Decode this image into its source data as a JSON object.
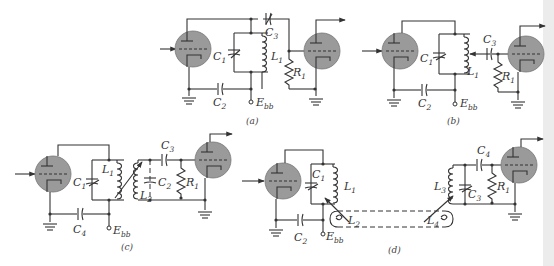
{
  "figure": {
    "colors": {
      "wire": "#333333",
      "tube_fill": "#9a9a9a",
      "background": "#ffffff",
      "right_margin": "#ececec"
    },
    "panels": [
      {
        "id": "a",
        "caption": "(a)",
        "labels": {
          "C1": "C",
          "C1_sub": "1",
          "L1": "L",
          "L1_sub": "1",
          "C2": "C",
          "C2_sub": "2",
          "C3": "C",
          "C3_sub": "3",
          "R1": "R",
          "R1_sub": "1",
          "Ebb": "E",
          "Ebb_sub": "bb"
        }
      },
      {
        "id": "b",
        "caption": "(b)",
        "labels": {
          "C1": "C",
          "C1_sub": "1",
          "L1": "L",
          "L1_sub": "1",
          "C2": "C",
          "C2_sub": "2",
          "C3": "C",
          "C3_sub": "3",
          "R1": "R",
          "R1_sub": "1",
          "Ebb": "E",
          "Ebb_sub": "bb"
        }
      },
      {
        "id": "c",
        "caption": "(c)",
        "labels": {
          "C1": "C",
          "C1_sub": "1",
          "L1": "L",
          "L1_sub": "1",
          "L2": "L",
          "L2_sub": "2",
          "C2": "C",
          "C2_sub": "2",
          "C3": "C",
          "C3_sub": "3",
          "C4": "C",
          "C4_sub": "4",
          "R1": "R",
          "R1_sub": "1",
          "Ebb": "E",
          "Ebb_sub": "bb"
        }
      },
      {
        "id": "d",
        "caption": "(d)",
        "labels": {
          "C1": "C",
          "C1_sub": "1",
          "L1": "L",
          "L1_sub": "1",
          "L2": "L",
          "L2_sub": "2",
          "C2": "C",
          "C2_sub": "2",
          "L3": "L",
          "L3_sub": "3",
          "L4": "L",
          "L4_sub": "4",
          "C3": "C",
          "C3_sub": "3",
          "C4": "C",
          "C4_sub": "4",
          "R1": "R",
          "R1_sub": "1",
          "Ebb": "E",
          "Ebb_sub": "bb"
        }
      }
    ]
  }
}
